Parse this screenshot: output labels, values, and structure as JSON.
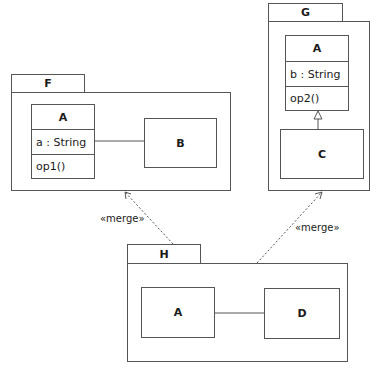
{
  "diagram": {
    "type": "UML package merge diagram",
    "packages": [
      {
        "name": "F",
        "classes": [
          {
            "name": "A",
            "attributes": [
              "a : String"
            ],
            "operations": [
              "op1()"
            ]
          },
          {
            "name": "B"
          }
        ],
        "relations": [
          {
            "type": "association",
            "from": "A",
            "to": "B"
          }
        ]
      },
      {
        "name": "G",
        "classes": [
          {
            "name": "A",
            "attributes": [
              "b : String"
            ],
            "operations": [
              "op2()"
            ]
          },
          {
            "name": "C"
          }
        ],
        "relations": [
          {
            "type": "generalization",
            "from": "C",
            "to": "A"
          }
        ]
      },
      {
        "name": "H",
        "classes": [
          {
            "name": "A"
          },
          {
            "name": "D"
          }
        ],
        "relations": [
          {
            "type": "association",
            "from": "A",
            "to": "D"
          }
        ]
      }
    ],
    "dependencies": [
      {
        "from": "H",
        "to": "F",
        "stereotype": "«merge»"
      },
      {
        "from": "H",
        "to": "G",
        "stereotype": "«merge»"
      }
    ]
  },
  "labels": {
    "F": "F",
    "G": "G",
    "H": "H",
    "F_A_name": "A",
    "F_A_attr": "a : String",
    "F_A_op": "op1()",
    "F_B": "B",
    "G_A_name": "A",
    "G_A_attr": "b : String",
    "G_A_op": "op2()",
    "G_C": "C",
    "H_A": "A",
    "H_D": "D",
    "merge_left": "«merge»",
    "merge_right": "«merge»"
  },
  "colors": {
    "line": "#555555",
    "background": "#ffffff",
    "text": "#1a1a1a"
  }
}
